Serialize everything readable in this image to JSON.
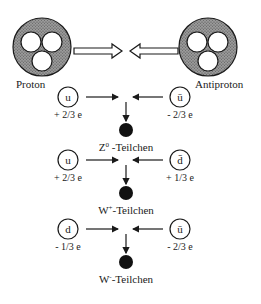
{
  "diagram": {
    "particles": {
      "left": {
        "label": "Proton"
      },
      "right": {
        "label": "Antiproton"
      }
    },
    "reactions": [
      {
        "left_quark": {
          "symbol": "u",
          "charge": "+ 2/3 e"
        },
        "right_quark": {
          "symbol": "ū",
          "charge": "- 2/3 e"
        },
        "product": {
          "name": "Z",
          "superscript": "0",
          "suffix": " -Teilchen"
        }
      },
      {
        "left_quark": {
          "symbol": "u",
          "charge": "+ 2/3 e"
        },
        "right_quark": {
          "symbol": "d̄",
          "charge": "+ 1/3 e"
        },
        "product": {
          "name": "W",
          "superscript": "+",
          "suffix": "-Teilchen"
        }
      },
      {
        "left_quark": {
          "symbol": "d",
          "charge": "- 1/3 e"
        },
        "right_quark": {
          "symbol": "ū",
          "charge": "- 2/3 e"
        },
        "product": {
          "name": "W",
          "superscript": "-",
          "suffix": "-Teilchen"
        }
      }
    ],
    "colors": {
      "ink": "#1a1a1a",
      "fill_stipple": "#8a8a8a",
      "background": "#ffffff"
    }
  }
}
